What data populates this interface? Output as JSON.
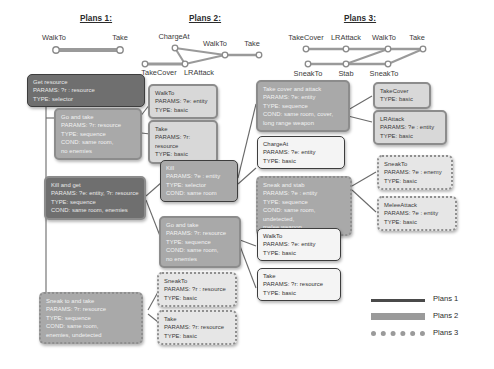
{
  "plans": [
    {
      "title": "Plans 1:",
      "top_nodes": [
        "WalkTo",
        "Take"
      ],
      "bottom_nodes": []
    },
    {
      "title": "Plans 2:",
      "top_nodes": [
        "ChargeAt",
        "WalkTo",
        "Take"
      ],
      "bottom_nodes": [
        "TakeCover",
        "LRAttack"
      ]
    },
    {
      "title": "Plans 3:",
      "top_nodes": [
        "TakeCover",
        "LRAttack",
        "WalkTo",
        "Take"
      ],
      "bottom_nodes": [
        "SneakTo",
        "Stab",
        "SneakTo"
      ]
    }
  ],
  "nodes": {
    "get_resource": "Get resource\nPARAMS: ?r : resource\nTYPE: selector",
    "go_and_take_1": "Go and take\nPARAMS: ?r: resource\nTYPE: sequence\nCOND: same room,\nno enemies",
    "kill_and_get": "Kill and get\nPARAMS: ?e: entity, ?r: resource\nTYPE: sequence\nCOND: same room, enemies",
    "sneak_to_and_take": "Sneak to and take\nPARAMS: ?r: resource\nTYPE: sequence\nCOND: same room,\nenemies, undetected",
    "walkto_1": "WalkTo\nPARAMS: ?e: entity\nTYPE: basic",
    "take_1": "Take\nPARAMS: ?r: resource\nTYPE: basic",
    "kill": "Kill\nPARAMS: ?e : entity\nTYPE: selector\nCOND: same room",
    "go_and_take_2": "Go and take\nPARAMS: ?r: resource\nTYPE: sequence\nCOND: same room,\nno enemies",
    "sneakto_mid": "SneakTo\nPARAMS: ?r : resource\nTYPE: basic",
    "take_mid": "Take\nPARAMS: ?r: resource\nTYPE: basic",
    "take_cover_and_attack": "Take cover and attack\nPARAMS: ?e: entity\nTYPE: sequence\nCOND: same room, cover,\nlong range weapon",
    "chargeat": "ChargeAt\nPARAMS: ?e: entity\nTYPE: basic",
    "sneak_and_stab": "Sneak and stab\nPARAMS: ?e : entity\nTYPE: sequence\nCOND: same room, undetected,\nmelee weapon",
    "walkto_2": "WalkTo\nPARAMS: ?e: entity\nTYPE: basic",
    "take_2": "Take\nPARAMS: ?r: resource\nTYPE: basic",
    "takecover": "TakeCover\nTYPE: basic",
    "lrattack": "LRAttack\nPARAMS: ?e : entity\nTYPE: basic",
    "sneakto_right": "SneakTo\nPARAMS: ?e : enemy\nTYPE: basic",
    "meleeattack": "MeleeAttack\nPARAMS: ?e : entity\nTYPE: basic"
  },
  "legend": [
    {
      "label": "Plans 1",
      "style": "solid"
    },
    {
      "label": "Plans 2",
      "style": "thick"
    },
    {
      "label": "Plans 3",
      "style": "dotted"
    }
  ]
}
